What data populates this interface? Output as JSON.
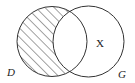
{
  "diagram": {
    "type": "venn",
    "sets": [
      {
        "id": "D",
        "label": "D",
        "cx": 52,
        "cy": 41.5,
        "r": 35
      },
      {
        "id": "G",
        "label": "G",
        "cx": 88.5,
        "cy": 41.5,
        "r": 35.5
      }
    ],
    "shaded_region": "D only (D minus G)",
    "shading_style": "diagonal hatch",
    "region_labels": [
      {
        "region": "G only",
        "text": "X"
      }
    ],
    "colors": {
      "stroke": "#333333",
      "hatch": "#444444",
      "background": "#ffffff"
    }
  }
}
